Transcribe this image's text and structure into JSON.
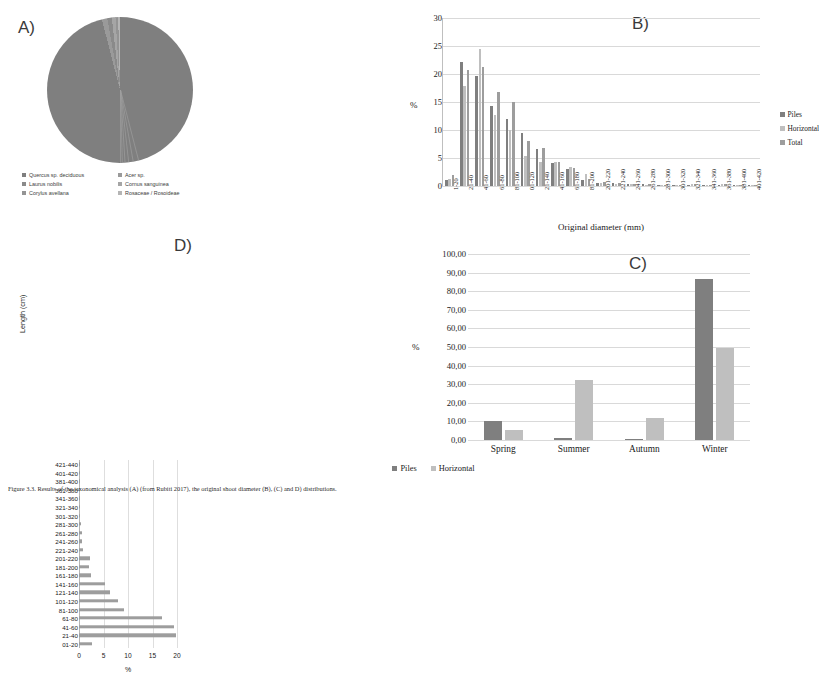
{
  "panels": {
    "a": {
      "letter": "A)",
      "legend": [
        {
          "label": "Quercus sp. deciduous",
          "color": "#7f7f7f"
        },
        {
          "label": "Acer sp.",
          "color": "#9a9a9a"
        },
        {
          "label": "Laurus nobilis",
          "color": "#8a8a8a"
        },
        {
          "label": "Cornus sanguinea",
          "color": "#a5a5a5"
        },
        {
          "label": "Corylus avellana",
          "color": "#949494"
        },
        {
          "label": "Rosaceae / Rosoideae",
          "color": "#b5b5b5"
        }
      ]
    },
    "b": {
      "letter": "B)",
      "ylabel": "%",
      "xlabel": "Original diameter (mm)",
      "legend": [
        "Piles",
        "Horizontal",
        "Total"
      ]
    },
    "c": {
      "letter": "C)",
      "ylabel": "%",
      "legend": [
        "Piles",
        "Horizontal"
      ]
    },
    "d": {
      "letter": "D)",
      "ylabel": "Length (cm)",
      "xlabel": "%"
    }
  },
  "colors": {
    "piles": "#7f7f7f",
    "horizontal": "#bfbfbf",
    "total": "#9d9d9d",
    "grid": "#d9d9d9"
  },
  "chart_data": [
    {
      "type": "pie",
      "title": "A) Taxa composition",
      "labels": [
        "Quercus sp. deciduous",
        "Acer sp.",
        "Laurus nobilis",
        "Cornus sanguinea",
        "Corylus avellana",
        "Rosaceae / Rosoideae"
      ],
      "values": [
        96.0,
        1.2,
        1.0,
        0.8,
        0.6,
        0.4
      ],
      "colors": [
        "#7f7f7f",
        "#9a9a9a",
        "#8a8a8a",
        "#a5a5a5",
        "#949494",
        "#b5b5b5"
      ],
      "legend_position": "bottom"
    },
    {
      "type": "bar",
      "title": "B) Original diameter distribution",
      "xlabel": "Original diameter (mm)",
      "ylabel": "%",
      "ylim": [
        0,
        30
      ],
      "yticks": [
        0,
        5,
        10,
        15,
        20,
        25,
        30
      ],
      "grid": true,
      "legend_position": "right",
      "categories": [
        "1-20",
        "21-40",
        "41-60",
        "61-80",
        "81-100",
        "01-120",
        "21-140",
        "41-160",
        "61-180",
        "81-200",
        "201-220",
        "221-240",
        "241-260",
        "261-280",
        "281-300",
        "301-320",
        "321-340",
        "341-360",
        "361-380",
        "381-400",
        "401-420"
      ],
      "series": [
        {
          "name": "Piles",
          "values": [
            1.0,
            22.1,
            19.6,
            14.2,
            12.0,
            9.4,
            6.6,
            4.1,
            3.0,
            1.1,
            0.6,
            0.6,
            0.4,
            0.3,
            0.2,
            0.2,
            0.2,
            0.2,
            0.1,
            0.1,
            0.1
          ]
        },
        {
          "name": "Horizontal",
          "values": [
            1.3,
            17.8,
            24.5,
            12.6,
            10.0,
            5.4,
            4.2,
            4.2,
            3.4,
            2.1,
            0.5,
            0.4,
            0.3,
            0.2,
            0.2,
            0.2,
            0.4,
            0.1,
            0.4,
            0.1,
            0.1
          ]
        },
        {
          "name": "Total",
          "values": [
            2.0,
            20.8,
            21.2,
            16.8,
            15.0,
            8.1,
            6.8,
            4.2,
            3.3,
            1.3,
            0.7,
            0.6,
            0.4,
            0.3,
            0.2,
            0.2,
            0.3,
            0.2,
            0.3,
            0.1,
            0.1
          ]
        }
      ]
    },
    {
      "type": "bar",
      "title": "C) Seasonality",
      "xlabel": "",
      "ylabel": "%",
      "ylim": [
        0,
        100
      ],
      "yticks": [
        "0,00",
        "10,00",
        "20,00",
        "30,00",
        "40,00",
        "50,00",
        "60,00",
        "70,00",
        "80,00",
        "90,00",
        "100,00"
      ],
      "grid": true,
      "legend_position": "bottom",
      "categories": [
        "Spring",
        "Summer",
        "Autumn",
        "Winter"
      ],
      "series": [
        {
          "name": "Piles",
          "values": [
            10.3,
            1.2,
            0.8,
            86.5
          ]
        },
        {
          "name": "Horizontal",
          "values": [
            5.4,
            32.2,
            12.0,
            49.5
          ]
        }
      ]
    },
    {
      "type": "bar",
      "orientation": "horizontal",
      "title": "D) Length distribution",
      "xlabel": "%",
      "ylabel": "Length (cm)",
      "xlim": [
        0,
        20
      ],
      "xticks": [
        0,
        5,
        10,
        15,
        20
      ],
      "grid": true,
      "categories": [
        "01-20",
        "21-40",
        "41-60",
        "61-80",
        "81-100",
        "101-120",
        "121-140",
        "141-160",
        "161-180",
        "181-200",
        "201-220",
        "221-240",
        "241-260",
        "261-280",
        "281-300",
        "301-320",
        "321-340",
        "341-360",
        "361-380",
        "381-400",
        "401-420",
        "421-440"
      ],
      "values": [
        2.7,
        19.7,
        19.3,
        16.9,
        9.1,
        8.0,
        6.4,
        5.4,
        2.4,
        2.1,
        2.2,
        0.9,
        0.7,
        0.7,
        0.4,
        0.0,
        0.3,
        0.3,
        0.0,
        0.0,
        0.0,
        0.2
      ]
    }
  ],
  "caption": "Figure 3.3. Results of the taxonomical analysis (A) (from Rubiti 2017), the original shoot diameter (B), (C) and D) distributions."
}
